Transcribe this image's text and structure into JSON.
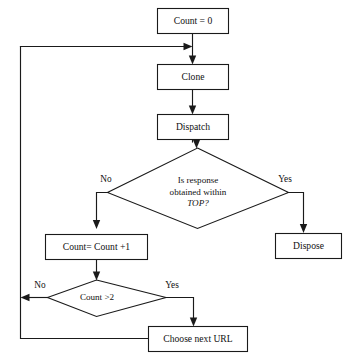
{
  "diagram": {
    "type": "flowchart",
    "title": "",
    "background_color": "#ffffff",
    "line_color": "#1a1a1a",
    "text_color": "#111111",
    "nodes": [
      {
        "id": "count_init",
        "shape": "rectangle",
        "label": "Count = 0"
      },
      {
        "id": "clone",
        "shape": "rectangle",
        "label": "Clone"
      },
      {
        "id": "dispatch",
        "shape": "rectangle",
        "label": "Dispatch"
      },
      {
        "id": "response_check",
        "shape": "diamond",
        "label_line1": "Is response",
        "label_line2": "obtained within",
        "label_line3": "TOP?",
        "emphasis": "TOP?"
      },
      {
        "id": "dispose",
        "shape": "rectangle",
        "label": "Dispose"
      },
      {
        "id": "count_increment",
        "shape": "rectangle",
        "label": "Count= Count +1"
      },
      {
        "id": "count_threshold",
        "shape": "diamond",
        "label": "Count >2"
      },
      {
        "id": "choose_next_url",
        "shape": "rectangle",
        "label": "Choose next URL"
      }
    ],
    "branch_labels": {
      "response_no": "No",
      "response_yes": "Yes",
      "threshold_no": "No",
      "threshold_yes": "Yes"
    },
    "edges": [
      {
        "from": "count_init",
        "to": "clone",
        "label": ""
      },
      {
        "from": "clone",
        "to": "dispatch",
        "label": ""
      },
      {
        "from": "dispatch",
        "to": "response_check",
        "label": ""
      },
      {
        "from": "response_check",
        "to": "dispose",
        "label": "Yes"
      },
      {
        "from": "response_check",
        "to": "count_increment",
        "label": "No"
      },
      {
        "from": "count_increment",
        "to": "count_threshold",
        "label": ""
      },
      {
        "from": "count_threshold",
        "to": "clone",
        "label": "No"
      },
      {
        "from": "count_threshold",
        "to": "choose_next_url",
        "label": "Yes"
      },
      {
        "from": "choose_next_url",
        "to": "clone",
        "label": ""
      }
    ]
  }
}
